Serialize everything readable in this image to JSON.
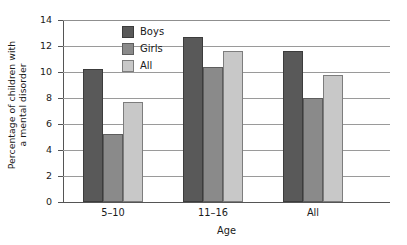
{
  "chart_data": {
    "type": "bar",
    "title": "",
    "subtitle": "",
    "xlabel": "Age",
    "ylabel": "Percentage of children with a mental disorder",
    "ylabel_lines": [
      "Percentage of children with",
      "a mental disorder"
    ],
    "categories": [
      "5–10",
      "11–16",
      "All"
    ],
    "series": [
      {
        "name": "Boys",
        "color": "#595959",
        "values": [
          10.2,
          12.7,
          11.6
        ]
      },
      {
        "name": "Girls",
        "color": "#8a8a8a",
        "values": [
          5.2,
          10.4,
          8.0
        ]
      },
      {
        "name": "All",
        "color": "#c8c8c8",
        "values": [
          7.7,
          11.6,
          9.8
        ]
      }
    ],
    "ylim": [
      0,
      14
    ],
    "ytick_values": [
      0,
      2,
      4,
      6,
      8,
      10,
      12,
      14
    ],
    "ytick_labels": [
      "0",
      "2",
      "4",
      "6",
      "8",
      "10",
      "12",
      "14"
    ],
    "grid": "horizontal",
    "legend_position": "inside-upper-left",
    "legend_entries": [
      "Boys",
      "Girls",
      "All"
    ],
    "background_color": "#ffffff",
    "axis_color": "#555555",
    "gridline_color": "#9a9a9a"
  }
}
